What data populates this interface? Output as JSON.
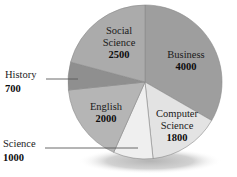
{
  "chart_data": {
    "type": "pie",
    "title": "",
    "subtitle": "",
    "xlabel": "",
    "ylabel": "",
    "legend_position": "none",
    "grid": false,
    "total": 12000,
    "categories": [
      "Business",
      "Computer Science",
      "Science",
      "English",
      "History",
      "Social Science"
    ],
    "values": [
      4000,
      1800,
      1000,
      2000,
      700,
      2500
    ],
    "slices": [
      {
        "name": "Business",
        "label": "Business",
        "value": 4000,
        "value_text": "4000",
        "percent": 33.3,
        "color": "#9e9e9e",
        "label_placement": "inside",
        "start_angle": 0,
        "end_angle": 120
      },
      {
        "name": "Computer Science",
        "label_line1": "Computer",
        "label_line2": "Science",
        "value": 1800,
        "value_text": "1800",
        "percent": 15.0,
        "color": "#e3e3e3",
        "label_placement": "inside",
        "start_angle": 120,
        "end_angle": 174
      },
      {
        "name": "Science",
        "label": "Science",
        "value": 1000,
        "value_text": "1000",
        "percent": 8.3,
        "color": "#efefef",
        "label_placement": "outside-left",
        "start_angle": 174,
        "end_angle": 204
      },
      {
        "name": "English",
        "label": "English",
        "value": 2000,
        "value_text": "2000",
        "percent": 16.7,
        "color": "#b5b5b5",
        "label_placement": "inside",
        "start_angle": 204,
        "end_angle": 264
      },
      {
        "name": "History",
        "label": "History",
        "value": 700,
        "value_text": "700",
        "percent": 5.8,
        "color": "#8f8f8f",
        "label_placement": "outside-left",
        "start_angle": 264,
        "end_angle": 285
      },
      {
        "name": "Social Science",
        "label_line1": "Social",
        "label_line2": "Science",
        "value": 2500,
        "value_text": "2500",
        "percent": 20.8,
        "color": "#ababab",
        "label_placement": "inside",
        "start_angle": 285,
        "end_angle": 360
      }
    ],
    "colors": {
      "business": "#9e9e9e",
      "computer_science": "#e3e3e3",
      "science": "#efefef",
      "english": "#b5b5b5",
      "history": "#8f8f8f",
      "social_science": "#ababab",
      "shadow": "#c9c9c9",
      "outline": "#8a8a8a",
      "leader_line": "#595959",
      "text": "#1a1a1a",
      "background": "#ffffff"
    }
  }
}
